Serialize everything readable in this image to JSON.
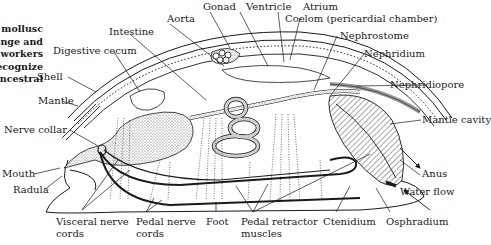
{
  "caption_fragment": {
    "lines": [
      "mollusc",
      "onge and",
      "workers.",
      "recognize",
      "ancestral"
    ]
  },
  "labels": {
    "gonad": "Gonad",
    "ventricle": "Ventricle",
    "atrium": "Atrium",
    "coelom": "Coelom (pericardial chamber)",
    "aorta": "Aorta",
    "intestine": "Intestine",
    "nephrostome": "Nephrostome",
    "digestive_cecum": "Digestive cecum",
    "nephridium": "Nephridium",
    "shell": "Shell",
    "nephridiopore": "Nephridiopore",
    "mantle": "Mantle",
    "nerve_collar": "Nerve collar",
    "mantle_cavity": "Mantle cavity",
    "anus": "Anus",
    "mouth": "Mouth",
    "water_flow": "Water flow",
    "radula": "Radula",
    "visceral_nerve_cords_1": "Visceral nerve",
    "visceral_nerve_cords_2": "cords",
    "pedal_nerve_cords_1": "Pedal nerve",
    "pedal_nerve_cords_2": "cords",
    "foot": "Foot",
    "pedal_retractor_muscles_1": "Pedal retractor",
    "pedal_retractor_muscles_2": "muscles",
    "ctenidium": "Ctenidium",
    "osphradium": "Osphradium"
  },
  "colors": {
    "ink": "#1a1a1a",
    "stipple": "#bdbdbd",
    "background": "#ffffff"
  }
}
